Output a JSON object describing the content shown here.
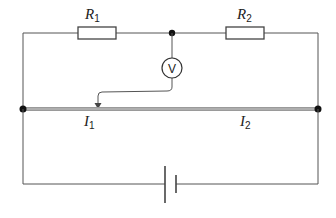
{
  "diagram": {
    "type": "circuit",
    "colors": {
      "wire": "#555555",
      "thick_wire": "#9a9a9a",
      "node": "#111111",
      "background": "#ffffff"
    },
    "components": {
      "resistor_1": {
        "label": "R",
        "subscript": "1"
      },
      "resistor_2": {
        "label": "R",
        "subscript": "2"
      },
      "voltmeter": {
        "symbol": "V"
      },
      "battery": {
        "label": ""
      },
      "resistance_wire": {
        "label": "uniform resistance wire"
      }
    },
    "currents": [
      {
        "label": "I",
        "subscript": "1"
      },
      {
        "label": "I",
        "subscript": "2"
      }
    ]
  }
}
